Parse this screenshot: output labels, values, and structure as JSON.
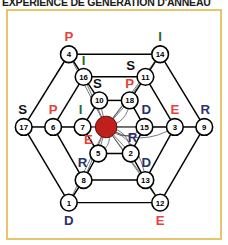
{
  "title": {
    "text": "EXPÉRIENCE DE GÉNÉRATION D'ANNEAU"
  },
  "frame": {
    "border_color": "#e8c46a",
    "background_color": "#ffffff"
  },
  "palette": {
    "letter_red": "#e8413c",
    "letter_green": "#1f6b33",
    "letter_black": "#111111",
    "letter_blue": "#29306b",
    "edge_black": "#000000",
    "center_marker_red": "#c0201c"
  },
  "legend": {
    "letters": [
      "S",
      "P",
      "I",
      "D",
      "E",
      "R"
    ],
    "center_marker_label": "spider-body"
  },
  "graph": {
    "node_count": 18,
    "ring_count": 3,
    "center_marker": {
      "cx": 100,
      "cy": 118,
      "r": 11
    },
    "nodes": [
      {
        "id": "4",
        "cx": 62,
        "cy": 44,
        "ring": "outer",
        "letter": "P",
        "color": "#e8413c",
        "letter_dx": 0,
        "letter_dy": -18
      },
      {
        "id": "14",
        "cx": 155,
        "cy": 44,
        "ring": "outer",
        "letter": "I",
        "color": "#1f6b33",
        "letter_dx": 0,
        "letter_dy": -18
      },
      {
        "id": "17",
        "cx": 16,
        "cy": 118,
        "ring": "outer",
        "letter": "S",
        "color": "#111111",
        "letter_dx": -1,
        "letter_dy": -18
      },
      {
        "id": "9",
        "cx": 200,
        "cy": 118,
        "ring": "outer",
        "letter": "R",
        "color": "#29306b",
        "letter_dx": 1,
        "letter_dy": -18
      },
      {
        "id": "1",
        "cx": 62,
        "cy": 195,
        "ring": "outer",
        "letter": "D",
        "color": "#29306b",
        "letter_dx": 0,
        "letter_dy": 18
      },
      {
        "id": "12",
        "cx": 155,
        "cy": 195,
        "ring": "outer",
        "letter": "E",
        "color": "#e8413c",
        "letter_dx": 0,
        "letter_dy": 18
      },
      {
        "id": "16",
        "cx": 77,
        "cy": 67,
        "ring": "middle",
        "letter": "I",
        "color": "#1f6b33",
        "letter_dx": 0,
        "letter_dy": -17
      },
      {
        "id": "11",
        "cx": 140,
        "cy": 67,
        "ring": "middle",
        "letter": "S",
        "color": "#111111",
        "letter_dx": -15,
        "letter_dy": -12
      },
      {
        "id": "6",
        "cx": 46,
        "cy": 118,
        "ring": "middle",
        "letter": "P",
        "color": "#e8413c",
        "letter_dx": 0,
        "letter_dy": -18
      },
      {
        "id": "3",
        "cx": 170,
        "cy": 118,
        "ring": "middle",
        "letter": "E",
        "color": "#e8413c",
        "letter_dx": 0,
        "letter_dy": -18
      },
      {
        "id": "8",
        "cx": 77,
        "cy": 172,
        "ring": "middle",
        "letter": "R",
        "color": "#29306b",
        "letter_dx": -1,
        "letter_dy": -18
      },
      {
        "id": "13",
        "cx": 140,
        "cy": 172,
        "ring": "middle",
        "letter": "D",
        "color": "#29306b",
        "letter_dx": 1,
        "letter_dy": -18
      },
      {
        "id": "10",
        "cx": 93,
        "cy": 91,
        "ring": "inner",
        "letter": "S",
        "color": "#111111",
        "letter_dx": -2,
        "letter_dy": -17
      },
      {
        "id": "18",
        "cx": 124,
        "cy": 91,
        "ring": "inner",
        "letter": "P",
        "color": "#e8413c",
        "letter_dx": 0,
        "letter_dy": -17
      },
      {
        "id": "7",
        "cx": 76,
        "cy": 118,
        "ring": "inner",
        "letter": "I",
        "color": "#1f6b33",
        "letter_dx": -2,
        "letter_dy": -18
      },
      {
        "id": "15",
        "cx": 139,
        "cy": 118,
        "ring": "inner",
        "letter": "D",
        "color": "#29306b",
        "letter_dx": 2,
        "letter_dy": -18
      },
      {
        "id": "5",
        "cx": 92,
        "cy": 145,
        "ring": "inner",
        "letter": "E",
        "color": "#e8413c",
        "letter_dx": -10,
        "letter_dy": -14
      },
      {
        "id": "2",
        "cx": 125,
        "cy": 145,
        "ring": "inner",
        "letter": "R",
        "color": "#29306b",
        "letter_dx": 2,
        "letter_dy": -16
      }
    ],
    "ring_edges": [
      [
        "4",
        "14"
      ],
      [
        "14",
        "9"
      ],
      [
        "9",
        "12"
      ],
      [
        "12",
        "1"
      ],
      [
        "1",
        "17"
      ],
      [
        "17",
        "4"
      ],
      [
        "16",
        "11"
      ],
      [
        "11",
        "3"
      ],
      [
        "3",
        "13"
      ],
      [
        "13",
        "8"
      ],
      [
        "8",
        "6"
      ],
      [
        "6",
        "16"
      ],
      [
        "10",
        "18"
      ],
      [
        "18",
        "15"
      ],
      [
        "15",
        "2"
      ],
      [
        "2",
        "5"
      ],
      [
        "5",
        "7"
      ],
      [
        "7",
        "10"
      ]
    ],
    "spoke_edges": [
      [
        "4",
        "16"
      ],
      [
        "16",
        "10"
      ],
      [
        "14",
        "11"
      ],
      [
        "11",
        "18"
      ],
      [
        "17",
        "6"
      ],
      [
        "6",
        "7"
      ],
      [
        "9",
        "3"
      ],
      [
        "3",
        "15"
      ],
      [
        "1",
        "8"
      ],
      [
        "8",
        "5"
      ],
      [
        "12",
        "13"
      ],
      [
        "13",
        "2"
      ]
    ]
  }
}
